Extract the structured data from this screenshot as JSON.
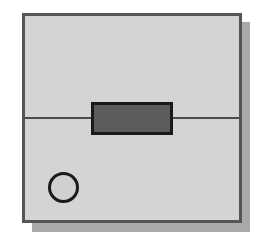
{
  "diagram": {
    "colors": {
      "panel_fill": "#d4d4d4",
      "panel_border": "#555555",
      "shadow": "#a9a9a9",
      "slot_fill": "#5c5c5c",
      "outline": "#1a1a1a"
    },
    "shapes": [
      {
        "name": "panel",
        "type": "rectangle"
      },
      {
        "name": "divider",
        "type": "line"
      },
      {
        "name": "slot",
        "type": "rectangle"
      },
      {
        "name": "indicator",
        "type": "circle"
      }
    ]
  }
}
